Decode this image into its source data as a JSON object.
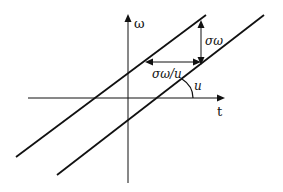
{
  "diagram": {
    "axes": {
      "x_label": "t",
      "y_label": "ω"
    },
    "annotations": {
      "vertical_offset": "σω",
      "horizontal_offset": "σω/u",
      "angle": "u"
    },
    "colors": {
      "ink": "#111111",
      "background": "#ffffff"
    }
  }
}
